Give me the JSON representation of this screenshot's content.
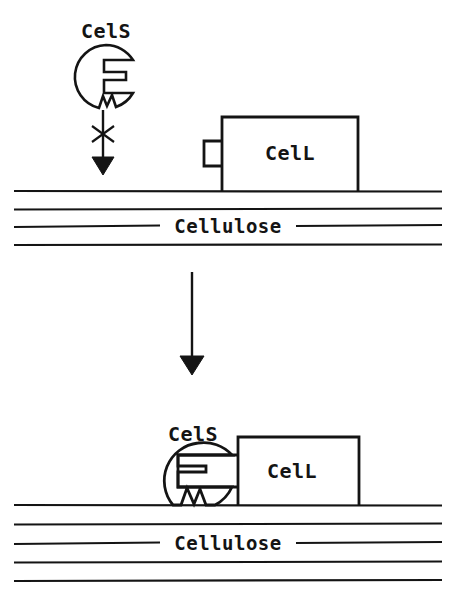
{
  "figure": {
    "background_color": "#ffffff",
    "ink_color": "#141414",
    "width": 456,
    "height": 598
  },
  "panels": {
    "top": {
      "name": "unbound-state",
      "cels": {
        "label": "CelS",
        "label_x": 106,
        "label_y": 38,
        "shape": "notched-circle",
        "cx": 106,
        "cy": 77,
        "r": 32
      },
      "cell": {
        "label": "CelL",
        "label_x": 290,
        "label_y": 160,
        "shape": "tabbed-box",
        "box_left": 222,
        "box_top": 117,
        "box_right": 358,
        "box_bottom": 191,
        "tab_left": 204,
        "tab_top": 141,
        "tab_bottom": 166
      },
      "blocked_arrow": {
        "name": "blocked-binding-arrow",
        "x": 103,
        "y_start": 110,
        "y_end": 172,
        "marker": "x-cross",
        "marker_y": 134,
        "meaning": "binding blocked"
      },
      "cellulose": {
        "label": "Cellulose",
        "label_x": 228,
        "label_y": 229,
        "line_count": 4,
        "line_ys": [
          191,
          209,
          226,
          245
        ],
        "label_line_index": 2,
        "gap_left": 160,
        "gap_right": 296
      }
    },
    "transition": {
      "name": "transition-arrow",
      "x": 192,
      "y_start": 272,
      "y_end": 372
    },
    "bottom": {
      "name": "bound-complex-state",
      "cels": {
        "label": "CelS",
        "label_x": 193,
        "label_y": 441,
        "shape": "notched-circle",
        "cx": 195,
        "cy": 476,
        "r": 38
      },
      "cell": {
        "label": "CelL",
        "label_x": 292,
        "label_y": 478,
        "shape": "tabbed-box",
        "box_left": 238,
        "box_top": 437,
        "box_right": 359,
        "box_bottom": 505,
        "tab_left": 178,
        "tab_top": 455,
        "tab_bottom": 487
      },
      "cellulose": {
        "label": "Cellulose",
        "label_x": 228,
        "label_y": 546,
        "line_count": 5,
        "line_ys": [
          505,
          524,
          543,
          562,
          581
        ],
        "label_line_index": 2,
        "gap_left": 160,
        "gap_right": 296
      }
    }
  }
}
